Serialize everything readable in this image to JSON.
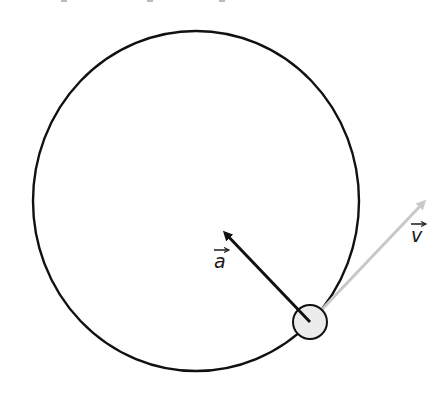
{
  "diagram": {
    "colors": {
      "background": "#ffffff",
      "path_stroke": "#111111",
      "acceleration_vector": "#111111",
      "velocity_vector": "#c8c8c8",
      "particle_fill": "#ececec",
      "particle_stroke": "#111111",
      "label": "#1a1a1a"
    },
    "path": {
      "shape": "circle",
      "center": [
        196,
        201
      ],
      "rx": 163,
      "ry": 170
    },
    "particle": {
      "center": [
        310,
        322
      ],
      "radius": 17
    },
    "vectors": [
      {
        "id": "acceleration",
        "label": "a",
        "from": [
          310,
          322
        ],
        "to": [
          225,
          233
        ],
        "label_pos": [
          214,
          266
        ]
      },
      {
        "id": "velocity",
        "label": "v",
        "from": [
          310,
          322
        ],
        "to": [
          424,
          202
        ],
        "label_pos": [
          412,
          240
        ]
      }
    ],
    "top_fragments": [
      [
        64,
        0
      ],
      [
        150,
        0
      ],
      [
        222,
        0
      ]
    ]
  }
}
